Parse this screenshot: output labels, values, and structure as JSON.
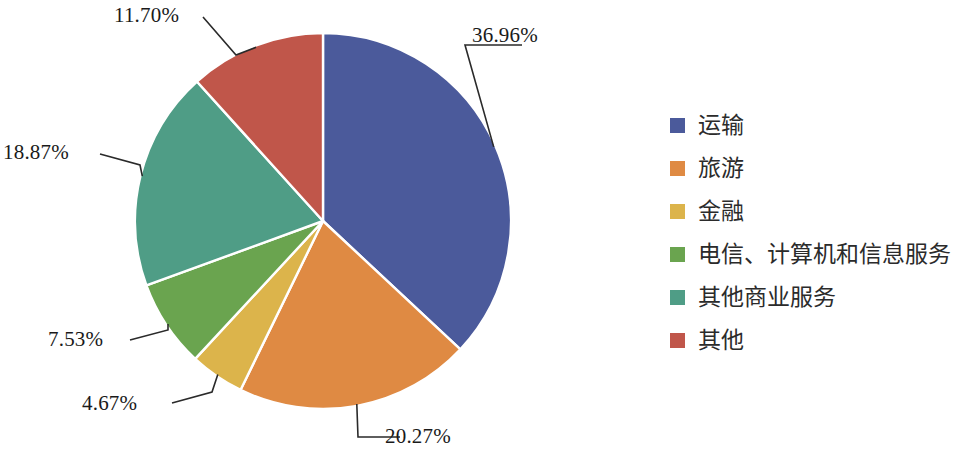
{
  "chart_data": {
    "type": "pie",
    "title": "",
    "subtitle": "",
    "xlabel": "",
    "ylabel": "",
    "legend_position": "right",
    "grid": false,
    "unit": "%",
    "start_angle_deg": 0,
    "direction": "clockwise",
    "categories": [
      "运输",
      "旅游",
      "金融",
      "电信、计算机和信息服务",
      "其他商业服务",
      "其他"
    ],
    "values": [
      36.96,
      20.27,
      4.67,
      7.53,
      18.87,
      11.7
    ],
    "value_labels": [
      "36.96%",
      "20.27%",
      "4.67%",
      "7.53%",
      "18.87%",
      "11.70%"
    ],
    "colors": [
      "#4b5a9b",
      "#df8a43",
      "#dcb44b",
      "#6aa44f",
      "#4f9d86",
      "#c0564a"
    ],
    "slices": [
      {
        "name": "运输",
        "value": 36.96,
        "label": "36.96%",
        "color": "#4b5a9b"
      },
      {
        "name": "旅游",
        "value": 20.27,
        "label": "20.27%",
        "color": "#df8a43"
      },
      {
        "name": "金融",
        "value": 4.67,
        "label": "4.67%",
        "color": "#dcb44b"
      },
      {
        "name": "电信、计算机和信息服务",
        "value": 7.53,
        "label": "7.53%",
        "color": "#6aa44f"
      },
      {
        "name": "其他商业服务",
        "value": 18.87,
        "label": "18.87%",
        "color": "#4f9d86"
      },
      {
        "name": "其他",
        "value": 11.7,
        "label": "11.70%",
        "color": "#c0564a"
      }
    ],
    "total": 100.0
  },
  "labels": {
    "transport_pct": "36.96%",
    "tourism_pct": "20.27%",
    "finance_pct": "4.67%",
    "telecom_pct": "7.53%",
    "other_business_pct": "18.87%",
    "other_pct": "11.70%"
  },
  "legend": {
    "items": [
      {
        "label": "运输",
        "color": "#4b5a9b"
      },
      {
        "label": "旅游",
        "color": "#df8a43"
      },
      {
        "label": "金融",
        "color": "#dcb44b"
      },
      {
        "label": "电信、计算机和信息服务",
        "color": "#6aa44f"
      },
      {
        "label": "其他商业服务",
        "color": "#4f9d86"
      },
      {
        "label": "其他",
        "color": "#c0564a"
      }
    ]
  }
}
